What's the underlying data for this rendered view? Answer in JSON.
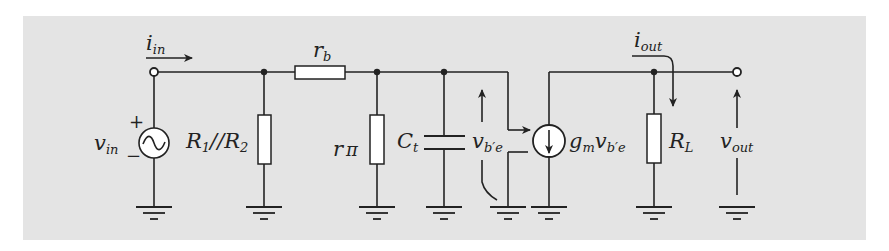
{
  "diagram": {
    "type": "small-signal equivalent circuit (hybrid-pi)",
    "background_color": "#e4e4e4",
    "line_color": "#222222",
    "labels": {
      "i_in": {
        "base": "i",
        "sub": "in"
      },
      "v_in": {
        "base": "v",
        "sub": "in"
      },
      "plus": "+",
      "minus": "−",
      "r1r2": {
        "a": "R",
        "a_sub": "1",
        "sep": "//",
        "b": "R",
        "b_sub": "2"
      },
      "r_b": {
        "base": "r",
        "sub": "b"
      },
      "r_pi": {
        "base": "r",
        "sub": "π"
      },
      "c_t": {
        "base": "C",
        "sub": "t"
      },
      "v_be": {
        "base": "v",
        "sub": "b′e"
      },
      "gm_vbe": {
        "g": "g",
        "g_sub": "m",
        "v": "v",
        "v_sub": "b′e"
      },
      "i_out": {
        "base": "i",
        "sub": "out"
      },
      "r_l": {
        "base": "R",
        "sub": "L"
      },
      "v_out": {
        "base": "v",
        "sub": "out"
      }
    },
    "components": [
      {
        "id": "vin",
        "kind": "ac-voltage-source",
        "label": "v_in"
      },
      {
        "id": "r1r2",
        "kind": "resistor",
        "label": "R1//R2"
      },
      {
        "id": "rb",
        "kind": "resistor",
        "label": "r_b"
      },
      {
        "id": "rpi",
        "kind": "resistor",
        "label": "r_π"
      },
      {
        "id": "ct",
        "kind": "capacitor",
        "label": "C_t"
      },
      {
        "id": "gm",
        "kind": "dependent-current-source",
        "label": "g_m v_b'e"
      },
      {
        "id": "rl",
        "kind": "resistor",
        "label": "R_L"
      }
    ],
    "grounds": 8
  }
}
